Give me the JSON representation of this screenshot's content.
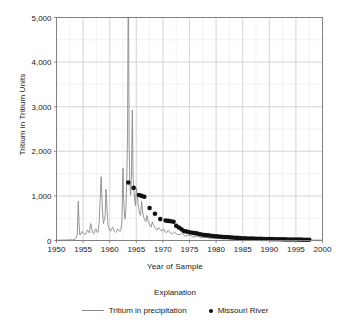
{
  "chart_data": {
    "type": "line",
    "title": "",
    "xlabel": "Year of Sample",
    "ylabel": "Tritium in Tritium Units",
    "xlim": [
      1950,
      2000
    ],
    "ylim": [
      0,
      5000
    ],
    "xticks": [
      1950,
      1955,
      1960,
      1965,
      1970,
      1975,
      1980,
      1985,
      1990,
      1995,
      2000
    ],
    "xtick_labels": [
      "1950",
      "1955",
      "1960",
      "1965",
      "1970",
      "1975",
      "1980",
      "1985",
      "1990",
      "1995",
      "2000"
    ],
    "yticks": [
      0,
      1000,
      2000,
      3000,
      4000,
      5000
    ],
    "ytick_labels": [
      "0",
      "1,000",
      "2,000",
      "3,000",
      "4,000",
      "5,000"
    ],
    "grid": true,
    "minor_grid_x_step": 2.5,
    "minor_grid_y_step": 500,
    "legend_position": "below",
    "legend_title": "Explanation",
    "note": "1963 precipitation peak is clipped at the top of the 5,000 TU axis",
    "series": [
      {
        "name": "Tritium in precipitation",
        "type": "line",
        "color": "#8a8a8a",
        "x": [
          1950.0,
          1950.5,
          1951.0,
          1951.5,
          1952.0,
          1952.5,
          1953.0,
          1953.3,
          1953.6,
          1953.9,
          1954.1,
          1954.25,
          1954.4,
          1954.6,
          1954.8,
          1955.0,
          1955.2,
          1955.4,
          1955.6,
          1955.8,
          1956.0,
          1956.2,
          1956.4,
          1956.6,
          1956.8,
          1957.0,
          1957.2,
          1957.4,
          1957.6,
          1957.8,
          1958.0,
          1958.2,
          1958.4,
          1958.6,
          1958.8,
          1959.0,
          1959.15,
          1959.3,
          1959.5,
          1959.7,
          1959.9,
          1960.1,
          1960.3,
          1960.5,
          1960.7,
          1960.9,
          1961.1,
          1961.3,
          1961.5,
          1961.7,
          1961.9,
          1962.1,
          1962.3,
          1962.4,
          1962.5,
          1962.6,
          1962.75,
          1962.9,
          1963.05,
          1963.2,
          1963.35,
          1963.45,
          1963.5,
          1963.55,
          1963.65,
          1963.8,
          1963.95,
          1964.1,
          1964.25,
          1964.4,
          1964.55,
          1964.7,
          1964.85,
          1965.0,
          1965.2,
          1965.4,
          1965.6,
          1965.8,
          1966.0,
          1966.2,
          1966.4,
          1966.6,
          1966.8,
          1967.0,
          1967.2,
          1967.4,
          1967.6,
          1967.8,
          1968.0,
          1968.3,
          1968.6,
          1968.9,
          1969.2,
          1969.5,
          1969.8,
          1970.1,
          1970.4,
          1970.7,
          1971.0,
          1971.4,
          1971.8,
          1972.2,
          1972.6,
          1973.0,
          1973.5,
          1974.0,
          1974.5,
          1975.0,
          1975.5,
          1976.0,
          1976.5,
          1977.0,
          1977.5,
          1978.0,
          1978.5,
          1979.0,
          1980.0,
          1981.0,
          1982.0,
          1983.0,
          1984.0,
          1985.0,
          1986.0,
          1987.0,
          1988.0,
          1990.0,
          1992.0,
          1994.0,
          1996.0,
          1998.0,
          2000.0
        ],
        "y": [
          8,
          8,
          10,
          10,
          12,
          14,
          16,
          20,
          40,
          120,
          880,
          330,
          120,
          150,
          200,
          180,
          150,
          130,
          170,
          240,
          200,
          170,
          380,
          300,
          170,
          150,
          210,
          260,
          200,
          180,
          380,
          900,
          1430,
          760,
          380,
          470,
          560,
          1150,
          700,
          330,
          260,
          210,
          230,
          300,
          260,
          200,
          180,
          210,
          260,
          230,
          200,
          250,
          420,
          1150,
          1620,
          1050,
          620,
          480,
          700,
          1350,
          2350,
          5000,
          5000,
          5000,
          2100,
          1250,
          1020,
          1540,
          2920,
          1400,
          1150,
          900,
          780,
          1180,
          980,
          760,
          620,
          560,
          880,
          640,
          520,
          460,
          420,
          560,
          440,
          380,
          320,
          300,
          420,
          330,
          270,
          230,
          290,
          250,
          210,
          260,
          200,
          175,
          230,
          170,
          150,
          190,
          140,
          125,
          160,
          110,
          100,
          130,
          88,
          80,
          100,
          70,
          62,
          78,
          55,
          48,
          45,
          40,
          36,
          32,
          28,
          26,
          24,
          22,
          20,
          17,
          15,
          13,
          11,
          10,
          9
        ]
      },
      {
        "name": "Missouri River",
        "type": "scatter",
        "color": "#111111",
        "x": [
          1963.5,
          1964.5,
          1965.5,
          1966.0,
          1966.5,
          1967.5,
          1968.5,
          1969.5,
          1970.5,
          1971.0,
          1971.5,
          1972.0,
          1972.5,
          1973.0,
          1973.5,
          1974.0,
          1974.5,
          1975.0,
          1975.5,
          1976.0,
          1976.5,
          1977.0,
          1977.5,
          1978.0,
          1978.5,
          1979.0,
          1979.5,
          1980.0,
          1980.5,
          1981.0,
          1981.5,
          1982.0,
          1982.5,
          1983.0,
          1983.5,
          1984.0,
          1984.5,
          1985.0,
          1985.5,
          1986.0,
          1986.5,
          1987.0,
          1987.5,
          1988.0,
          1988.5,
          1989.0,
          1989.5,
          1990.0,
          1990.5,
          1991.0,
          1991.5,
          1992.0,
          1992.5,
          1993.0,
          1993.5,
          1994.0,
          1994.5,
          1995.0,
          1995.5,
          1996.0,
          1996.5,
          1997.0,
          1997.5
        ],
        "y": [
          1300,
          1180,
          1020,
          1000,
          980,
          730,
          600,
          480,
          450,
          440,
          430,
          420,
          330,
          290,
          250,
          210,
          200,
          185,
          175,
          165,
          155,
          140,
          130,
          120,
          115,
          105,
          100,
          95,
          90,
          85,
          80,
          78,
          72,
          68,
          62,
          58,
          55,
          52,
          50,
          46,
          44,
          42,
          40,
          38,
          36,
          35,
          33,
          32,
          30,
          29,
          28,
          27,
          26,
          25,
          24,
          23,
          22,
          21,
          20,
          19,
          18,
          17,
          16
        ]
      }
    ]
  }
}
